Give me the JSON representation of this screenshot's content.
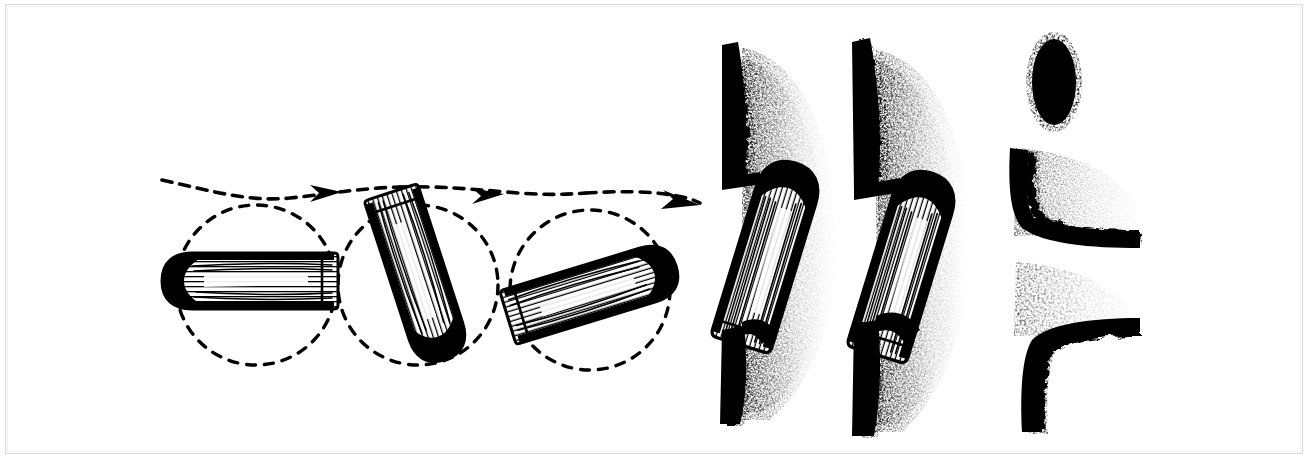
{
  "figure": {
    "title": "Bullet tumbling and wound channel formation",
    "style": "black-and-white stipple engraving",
    "background_color": "#ffffff",
    "ink_color": "#000000",
    "border_color": "#d8d8d8",
    "width": 1309,
    "height": 460
  },
  "panels": {
    "left": {
      "name": "tumbling-trajectory-sequence",
      "description": "Three successive positions of a rifle bullet rotating about its centre of mass while travelling left to right along a dashed flight path",
      "circle_radius": 80,
      "bullets": [
        {
          "index": 1,
          "label": "stage-1-yaw-0",
          "rotation_deg": 0,
          "center_x": 250,
          "center_y": 281,
          "length": 176,
          "width": 56,
          "nose_direction": "left",
          "circle": {
            "cx": 256,
            "cy": 285,
            "r": 80
          }
        },
        {
          "index": 2,
          "label": "stage-2-yaw-70",
          "rotation_deg": 72,
          "center_x": 418,
          "center_y": 276,
          "length": 176,
          "width": 56,
          "nose_direction": "up-left",
          "circle": {
            "cx": 418,
            "cy": 285,
            "r": 80
          }
        },
        {
          "index": 3,
          "label": "stage-3-yaw-165",
          "rotation_deg": 163,
          "center_x": 592,
          "center_y": 292,
          "length": 176,
          "width": 56,
          "nose_direction": "down-right",
          "circle": {
            "cx": 590,
            "cy": 290,
            "r": 80
          }
        }
      ],
      "trajectory": {
        "name": "dashed-flight-path",
        "style": "dashed",
        "dash_pattern": "10 8",
        "arrow_count": 3,
        "arrows": [
          {
            "x": 330,
            "y": 192,
            "angle_deg": -4
          },
          {
            "x": 492,
            "y": 196,
            "angle_deg": -2
          },
          {
            "x": 693,
            "y": 201,
            "angle_deg": 12
          }
        ]
      }
    },
    "right": {
      "name": "wound-channel-sequence",
      "description": "Three cross-sections of tissue showing the permanent cavity created as the yawing bullet passes through",
      "stages": [
        {
          "index": 1,
          "label": "wound-stage-1-entry",
          "bullet_rotation_deg": 17,
          "bullet_center_x": 768,
          "bullet_center_y": 254,
          "bullet_length": 190,
          "bullet_width": 62,
          "tissue_edge_x": 742,
          "stipple_density": "heavy"
        },
        {
          "index": 2,
          "label": "wound-stage-2-passage",
          "bullet_rotation_deg": 17,
          "bullet_center_x": 902,
          "bullet_center_y": 262,
          "bullet_length": 190,
          "bullet_width": 62,
          "tissue_edge_x": 876,
          "stipple_density": "heavy"
        },
        {
          "index": 3,
          "label": "wound-stage-3-exit",
          "bullet_rotation_deg": 0,
          "bullet_cross_section": {
            "cx": 1054,
            "cy": 82,
            "rx": 23,
            "ry": 45
          },
          "tissue_edge_x": 1010,
          "cavity_open": true,
          "stipple_density": "medium"
        }
      ]
    }
  },
  "legend": {
    "items": [
      {
        "name": "bullet-body",
        "description": "hatched metal jacket"
      },
      {
        "name": "bullet-nose",
        "description": "solid black ogive tip"
      },
      {
        "name": "dashed-circle",
        "description": "rotation envelope"
      },
      {
        "name": "dashed-path",
        "description": "line of flight"
      },
      {
        "name": "tissue-edge",
        "description": "torn tissue margin"
      },
      {
        "name": "stipple-spray",
        "description": "disrupted tissue / temporary cavity"
      }
    ]
  }
}
